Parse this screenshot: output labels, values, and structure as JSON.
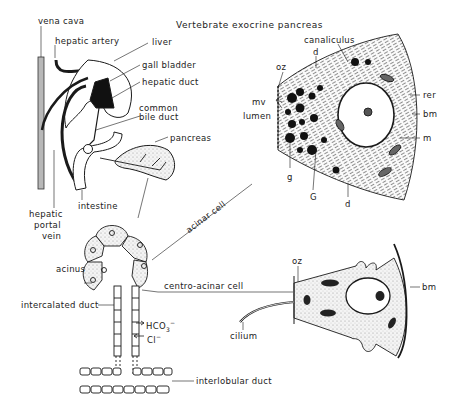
{
  "title": "Vertebrate exocrine pancreas",
  "organ_panel": {
    "labels": {
      "vena_cava": "vena cava",
      "hepatic_artery": "hepatic artery",
      "liver": "liver",
      "gall_bladder": "gall bladder",
      "hepatic_duct": "hepatic duct",
      "common_bile_duct_1": "common",
      "common_bile_duct_2": "bile duct",
      "pancreas": "pancreas",
      "intestine": "intestine",
      "hepatic_portal_vein_1": "hepatic",
      "hepatic_portal_vein_2": "portal",
      "hepatic_portal_vein_3": "vein"
    }
  },
  "duct_panel": {
    "labels": {
      "acinus": "acinus",
      "acinar_cell": "acinar cell",
      "centro_acinar_cell": "centro-acinar cell",
      "intercalated_duct": "intercalated duct",
      "bicarbonate": "HCO",
      "bicarbonate_sub": "3",
      "bicarbonate_sup": "−",
      "chloride": "Cl",
      "chloride_sup": "−",
      "interlobular_duct": "interlobular duct"
    }
  },
  "acinar_cell_panel": {
    "labels": {
      "canaliculus": "canaliculus",
      "d_top": "d",
      "oz": "oz",
      "mv": "mv",
      "lumen": "lumen",
      "g": "g",
      "G": "G",
      "d_bottom": "d",
      "rer": "rer",
      "bm": "bm",
      "m": "m"
    }
  },
  "centroacinar_cell_panel": {
    "labels": {
      "oz": "oz",
      "bm": "bm",
      "cilium": "cilium"
    }
  },
  "colors": {
    "ink": "#1a1a1a",
    "stipple": "#e4e4e4",
    "background": "#ffffff"
  }
}
